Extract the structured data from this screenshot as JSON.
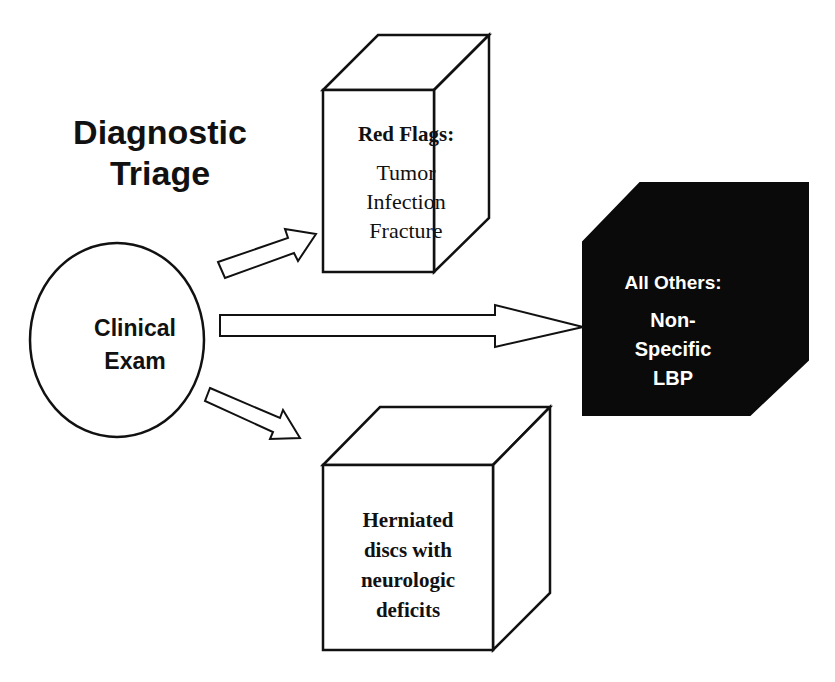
{
  "title": {
    "line1": "Diagnostic",
    "line2": "Triage"
  },
  "source_node": {
    "line1": "Clinical",
    "line2": "Exam",
    "shape": "ellipse"
  },
  "outcomes": {
    "red_flags": {
      "heading": "Red Flags:",
      "items": [
        "Tumor",
        "Infection",
        "Fracture"
      ],
      "shape": "cube-outline"
    },
    "all_others": {
      "heading": "All Others:",
      "items": [
        "Non-",
        "Specific",
        "LBP"
      ],
      "shape": "cube-filled",
      "fill": "#0a0a0a",
      "text_color": "#ffffff"
    },
    "herniated": {
      "lines": [
        "Herniated",
        "discs with",
        "neurologic",
        "deficits"
      ],
      "shape": "cube-outline"
    }
  },
  "arrows": [
    {
      "from": "Clinical Exam",
      "to": "Red Flags",
      "direction": "up-right"
    },
    {
      "from": "Clinical Exam",
      "to": "All Others",
      "direction": "right"
    },
    {
      "from": "Clinical Exam",
      "to": "Herniated discs",
      "direction": "down-right"
    }
  ],
  "colors": {
    "stroke": "#111111",
    "background": "#ffffff",
    "dark_box": "#0a0a0a"
  }
}
